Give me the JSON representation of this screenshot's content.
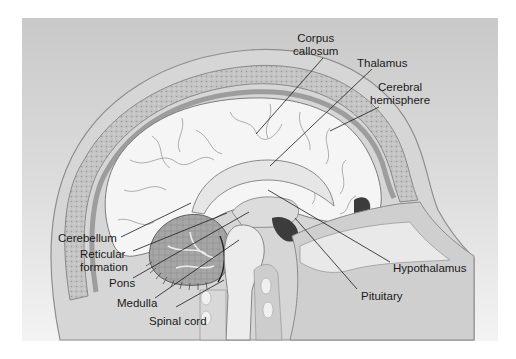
{
  "figure": {
    "background_colors": {
      "frame_top": "#c8c8c8",
      "frame_bottom": "#f2f2f2",
      "skull": "#a9a9a9",
      "bone_dots": "#d5d5d5",
      "brain": "#f4f4f4",
      "cerebellum": "#9c9c9c",
      "ventricle": "#3a3a3a"
    },
    "labels": {
      "corpus_callosum": [
        "Corpus",
        "callosum"
      ],
      "thalamus": "Thalamus",
      "cerebral_hemisphere": [
        "Cerebral",
        "hemisphere"
      ],
      "cerebellum": "Cerebellum",
      "reticular_formation": [
        "Reticular",
        "formation"
      ],
      "pons": "Pons",
      "medulla": "Medulla",
      "spinal_cord": "Spinal cord",
      "hypothalamus": "Hypothalamus",
      "pituitary": "Pituitary"
    }
  }
}
